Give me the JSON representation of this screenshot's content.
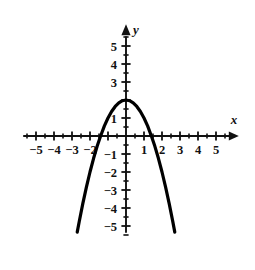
{
  "chart_data": {
    "type": "line",
    "title": "",
    "subtitle": "",
    "xlabel": "x",
    "ylabel": "y",
    "xlim": [
      -5.6,
      5.6
    ],
    "ylim": [
      -5.6,
      5.6
    ],
    "grid": false,
    "legend": null,
    "series": [
      {
        "name": "y = -x^2 + 2",
        "equation": "y = -x^2 + 2",
        "vertex": [
          0,
          2
        ],
        "roots": [
          -1.41,
          1.41
        ],
        "opens": "down",
        "color": "#000000",
        "x_domain": [
          -2.71,
          2.71
        ],
        "points": [
          [
            -2.71,
            -5.34
          ],
          [
            -2.6,
            -4.76
          ],
          [
            -2.4,
            -3.76
          ],
          [
            -2.2,
            -2.84
          ],
          [
            -2.0,
            -2.0
          ],
          [
            -1.8,
            -1.24
          ],
          [
            -1.6,
            -0.56
          ],
          [
            -1.41,
            0.0
          ],
          [
            -1.2,
            0.56
          ],
          [
            -1.0,
            1.0
          ],
          [
            -0.8,
            1.36
          ],
          [
            -0.6,
            1.64
          ],
          [
            -0.4,
            1.84
          ],
          [
            -0.2,
            1.96
          ],
          [
            0.0,
            2.0
          ],
          [
            0.2,
            1.96
          ],
          [
            0.4,
            1.84
          ],
          [
            0.6,
            1.64
          ],
          [
            0.8,
            1.36
          ],
          [
            1.0,
            1.0
          ],
          [
            1.2,
            0.56
          ],
          [
            1.41,
            0.0
          ],
          [
            1.6,
            -0.56
          ],
          [
            1.8,
            -1.24
          ],
          [
            2.0,
            -2.0
          ],
          [
            2.2,
            -2.84
          ],
          [
            2.4,
            -3.76
          ],
          [
            2.6,
            -4.76
          ],
          [
            2.71,
            -5.34
          ]
        ]
      }
    ],
    "x_axis": {
      "major_ticks": [
        -5,
        -4,
        -3,
        -2,
        -1,
        1,
        2,
        3,
        4,
        5
      ],
      "minor_ticks": [
        -5.5,
        -4.5,
        -3.5,
        -2.5,
        -1.5,
        -0.5,
        0.5,
        1.5,
        2.5,
        3.5,
        4.5,
        5.5
      ],
      "tick_labels": [
        {
          "value": -5,
          "text": "−5"
        },
        {
          "value": -4,
          "text": "−4"
        },
        {
          "value": -3,
          "text": "−3"
        },
        {
          "value": -2,
          "text": "−2"
        },
        {
          "value": 1,
          "text": "1"
        },
        {
          "value": 2,
          "text": "2"
        },
        {
          "value": 3,
          "text": "3"
        },
        {
          "value": 4,
          "text": "4"
        },
        {
          "value": 5,
          "text": "5"
        }
      ],
      "axis_label": "x",
      "arrow": "right"
    },
    "y_axis": {
      "major_ticks": [
        -5,
        -4,
        -3,
        -2,
        -1,
        1,
        2,
        3,
        4,
        5
      ],
      "minor_ticks": [
        -5.5,
        -4.5,
        -3.5,
        -2.5,
        -1.5,
        -0.5,
        0.5,
        1.5,
        2.5,
        3.5,
        4.5,
        5.5
      ],
      "tick_labels": [
        {
          "value": 5,
          "text": "5"
        },
        {
          "value": 4,
          "text": "4"
        },
        {
          "value": 3,
          "text": "3"
        },
        {
          "value": 1,
          "text": "1"
        },
        {
          "value": -1,
          "text": "−1"
        },
        {
          "value": -2,
          "text": "−2"
        },
        {
          "value": -3,
          "text": "−3"
        },
        {
          "value": -4,
          "text": "−4"
        },
        {
          "value": -5,
          "text": "−5"
        }
      ],
      "axis_label": "y",
      "arrow": "up"
    },
    "origin_px": [
      126,
      136
    ],
    "unit_px": 18.0
  }
}
